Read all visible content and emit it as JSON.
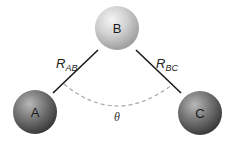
{
  "diagram": {
    "type": "triatomic-molecule-geometry",
    "atoms": [
      {
        "id": "A",
        "label": "A",
        "cx": 35,
        "cy": 112,
        "r": 22,
        "shade": "dark",
        "colors": {
          "highlight": "#b5b5b5",
          "mid": "#7a7a7a",
          "edge": "#3a3a3a"
        }
      },
      {
        "id": "B",
        "label": "B",
        "cx": 117,
        "cy": 28,
        "r": 22,
        "shade": "light",
        "colors": {
          "highlight": "#f2f2f2",
          "mid": "#cfcfcf",
          "edge": "#9a9a9a"
        }
      },
      {
        "id": "C",
        "label": "C",
        "cx": 200,
        "cy": 113,
        "r": 22,
        "shade": "dark",
        "colors": {
          "highlight": "#b5b5b5",
          "mid": "#7a7a7a",
          "edge": "#3a3a3a"
        }
      }
    ],
    "bonds": [
      {
        "id": "AB",
        "label_main": "R",
        "label_sub": "AB",
        "from": "A",
        "to": "B"
      },
      {
        "id": "BC",
        "label_main": "R",
        "label_sub": "BC",
        "from": "B",
        "to": "C"
      }
    ],
    "angle": {
      "label": "θ",
      "vertex": "B",
      "style": "dashed",
      "color": "#a8a8a8"
    },
    "bond_color": "#1a1a1a"
  }
}
